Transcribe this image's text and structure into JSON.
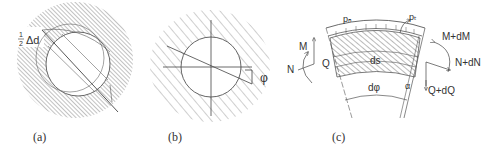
{
  "figure": {
    "panels": [
      {
        "id": "a",
        "caption": "(a)",
        "labels": {
          "delta": "Δd",
          "half_num": "1",
          "half_den": "2"
        }
      },
      {
        "id": "b",
        "caption": "(b)",
        "labels": {
          "angle": "φ"
        }
      },
      {
        "id": "c",
        "caption": "(c)",
        "labels": {
          "pn": "pₙ",
          "pt": "pₜ",
          "M": "M",
          "N": "N",
          "Q": "Q",
          "M_dM": "M+dM",
          "N_dN": "N+dN",
          "Q_dQ": "Q+dQ",
          "ds": "ds",
          "dphi": "dφ",
          "alpha": "α"
        }
      }
    ]
  },
  "colors": {
    "line": "#444444",
    "hatch": "#666666",
    "text": "#333333",
    "background": "#ffffff"
  }
}
